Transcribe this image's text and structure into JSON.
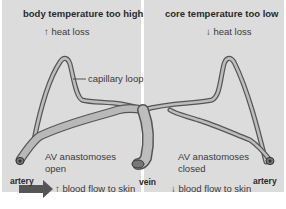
{
  "left_panel": {
    "title": "body temperature too high",
    "heat_loss": "↑ heat loss",
    "av_state_line1": "AV anastomoses",
    "av_state_line2": "open",
    "artery_label": "artery",
    "blood_flow": "↑ blood flow to skin"
  },
  "right_panel": {
    "title": "core temperature too low",
    "heat_loss": "↓ heat loss",
    "av_state_line1": "AV anastomoses",
    "av_state_line2": "closed",
    "artery_label": "artery",
    "blood_flow": "↓ blood flow to skin"
  },
  "center": {
    "capillary_label": "capillary loop",
    "vein_label": "vein"
  },
  "colors": {
    "panel_bg": "#dcdcdc",
    "vessel_fill": "#b8b8b8",
    "vessel_outline": "#555555",
    "arrow": "#555555"
  }
}
